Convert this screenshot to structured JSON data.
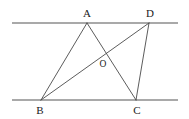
{
  "figure": {
    "background_color": "#ffffff",
    "parallel_line_color": "#8c8c8c",
    "segment_color": "#4a4a4a",
    "label_color": "#1a1a1a",
    "parallel_line_width": 1.6,
    "segment_line_width": 0.9
  },
  "points": {
    "A": {
      "label": "A",
      "x": 87,
      "y": 23,
      "label_x": 87,
      "label_y": 13
    },
    "B": {
      "label": "B",
      "x": 41,
      "y": 100,
      "label_x": 40,
      "label_y": 110
    },
    "C": {
      "label": "C",
      "x": 136,
      "y": 100,
      "label_x": 137,
      "label_y": 110
    },
    "D": {
      "label": "D",
      "x": 149,
      "y": 23,
      "label_x": 150,
      "label_y": 13
    },
    "O": {
      "label": "O",
      "x": 102,
      "y": 58,
      "label_x": 103,
      "label_y": 65
    }
  },
  "parallel_lines": [
    {
      "name": "top-parallel-line",
      "x1": 12,
      "y1": 23,
      "x2": 178,
      "y2": 23
    },
    {
      "name": "bottom-parallel-line",
      "x1": 12,
      "y1": 100,
      "x2": 178,
      "y2": 100
    }
  ],
  "segments": [
    {
      "name": "segment-AB",
      "from": "A",
      "to": "B",
      "x1": 87,
      "y1": 23,
      "x2": 41,
      "y2": 100
    },
    {
      "name": "segment-AC",
      "from": "A",
      "to": "C",
      "x1": 87,
      "y1": 23,
      "x2": 136,
      "y2": 100
    },
    {
      "name": "segment-BD",
      "from": "B",
      "to": "D",
      "x1": 41,
      "y1": 100,
      "x2": 149,
      "y2": 23
    },
    {
      "name": "segment-DC",
      "from": "D",
      "to": "C",
      "x1": 149,
      "y1": 23,
      "x2": 136,
      "y2": 100
    }
  ]
}
